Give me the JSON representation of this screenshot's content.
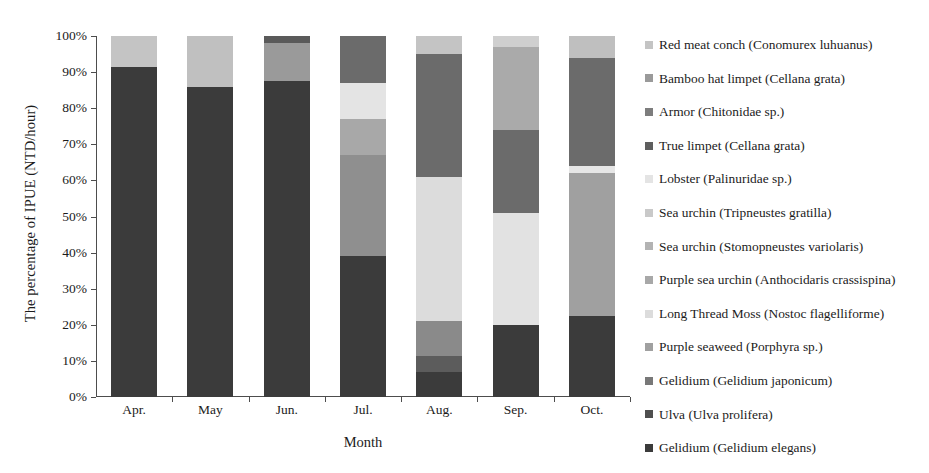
{
  "chart_data": {
    "type": "bar",
    "stacked": true,
    "stack_normalized": true,
    "title": "",
    "xlabel": "Month",
    "ylabel": "The percentage of IPUE (NTD/hour)",
    "categories": [
      "Apr.",
      "May",
      "Jun.",
      "Jul.",
      "Aug.",
      "Sep.",
      "Oct."
    ],
    "ylim": [
      0,
      100
    ],
    "ytick_labels": [
      "0%",
      "10%",
      "20%",
      "30%",
      "40%",
      "50%",
      "60%",
      "70%",
      "80%",
      "90%",
      "100%"
    ],
    "ytick_values": [
      0,
      10,
      20,
      30,
      40,
      50,
      60,
      70,
      80,
      90,
      100
    ],
    "grid": false,
    "legend_position": "right",
    "units": "percent",
    "series": [
      {
        "name": "Gelidium (Gelidium elegans)",
        "color": "#3b3b3b",
        "values": [
          91.5,
          86.0,
          87.5,
          39.0,
          7.0,
          20.0,
          22.5
        ]
      },
      {
        "name": "Ulva (Ulva prolifera)",
        "color": "#4f4f4f",
        "values": [
          0,
          0,
          0,
          0,
          4.5,
          0,
          0
        ]
      },
      {
        "name": "Gelidium (Gelidium japonicum)",
        "color": "#6e6e6e",
        "values": [
          0,
          0,
          0,
          0,
          9.5,
          0,
          0
        ]
      },
      {
        "name": "Purple seaweed (Porphyra sp.)",
        "color": "#8f8f8f",
        "values": [
          0,
          0,
          0,
          28.0,
          0,
          0,
          39.5
        ]
      },
      {
        "name": "Long Thread Moss (Nostoc flagelliforme)",
        "color": "#d9d9d9",
        "values": [
          0,
          0,
          0,
          0,
          40.0,
          31.0,
          2.0
        ]
      },
      {
        "name": "Purple sea urchin (Anthocidaris crassispina)",
        "color": "#a8a8a8",
        "values": [
          0,
          0,
          0,
          10.0,
          0,
          0,
          0
        ]
      },
      {
        "name": "Sea urchin (Stomopneustes variolaris)",
        "color": "#bdbdbd",
        "values": [
          0,
          0,
          0,
          0,
          0,
          0,
          0
        ]
      },
      {
        "name": "Sea urchin (Tripneustes gratilla)",
        "color": "#b3b3b3",
        "values": [
          0,
          0,
          0,
          0,
          0,
          23.0,
          0
        ]
      },
      {
        "name": "Lobster (Palinuridae sp.)",
        "color": "#e8e8e8",
        "values": [
          0,
          0,
          0,
          10.0,
          0,
          0,
          0
        ]
      },
      {
        "name": "True limpet (Cellana grata)",
        "color": "#666666",
        "values": [
          0,
          0,
          2.0,
          13.0,
          34.0,
          23.0,
          30.0
        ]
      },
      {
        "name": "Armor (Chitonidae sp.)",
        "color": "#7d7d7d",
        "values": [
          0,
          0,
          0,
          0,
          0,
          0,
          0
        ]
      },
      {
        "name": "Bamboo hat limpet (Cellana grata)",
        "color": "#9a9a9a",
        "values": [
          0,
          0,
          10.5,
          0,
          0,
          0,
          0
        ]
      },
      {
        "name": "Red meat conch (Conomurex luhuanus)",
        "color": "#c4c4c4",
        "values": [
          8.5,
          14.0,
          0,
          0,
          5.0,
          3.0,
          6.0
        ]
      }
    ],
    "stacks": [
      {
        "category": "Apr.",
        "segments": [
          {
            "label": "Gelidium (Gelidium elegans)",
            "from": 0,
            "to": 91.5,
            "value": 91.5,
            "color": "#3b3b3b"
          },
          {
            "label": "Red meat conch (Conomurex luhuanus)",
            "from": 91.5,
            "to": 100,
            "value": 8.5,
            "color": "#c4c4c4"
          }
        ]
      },
      {
        "category": "May",
        "segments": [
          {
            "label": "Gelidium (Gelidium elegans)",
            "from": 0,
            "to": 86.0,
            "value": 86.0,
            "color": "#3b3b3b"
          },
          {
            "label": "Red meat conch (Conomurex luhuanus)",
            "from": 86.0,
            "to": 100,
            "value": 14.0,
            "color": "#c0c0c0"
          }
        ]
      },
      {
        "category": "Jun.",
        "segments": [
          {
            "label": "Gelidium (Gelidium elegans)",
            "from": 0,
            "to": 87.5,
            "value": 87.5,
            "color": "#3b3b3b"
          },
          {
            "label": "Bamboo hat limpet (Cellana grata)",
            "from": 87.5,
            "to": 98.0,
            "value": 10.5,
            "color": "#9a9a9a"
          },
          {
            "label": "True limpet (Cellana grata)",
            "from": 98.0,
            "to": 100,
            "value": 2.0,
            "color": "#5a5a5a"
          }
        ]
      },
      {
        "category": "Jul.",
        "segments": [
          {
            "label": "Gelidium (Gelidium elegans)",
            "from": 0,
            "to": 39.0,
            "value": 39.0,
            "color": "#3b3b3b"
          },
          {
            "label": "Purple seaweed (Porphyra sp.)",
            "from": 39.0,
            "to": 67.0,
            "value": 28.0,
            "color": "#8f8f8f"
          },
          {
            "label": "Purple sea urchin (Anthocidaris crassispina)",
            "from": 67.0,
            "to": 77.0,
            "value": 10.0,
            "color": "#a8a8a8"
          },
          {
            "label": "Lobster (Palinuridae sp.)",
            "from": 77.0,
            "to": 87.0,
            "value": 10.0,
            "color": "#e4e4e4"
          },
          {
            "label": "True limpet (Cellana grata)",
            "from": 87.0,
            "to": 100,
            "value": 13.0,
            "color": "#6b6b6b"
          }
        ]
      },
      {
        "category": "Aug.",
        "segments": [
          {
            "label": "Gelidium (Gelidium elegans)",
            "from": 0,
            "to": 7.0,
            "value": 7.0,
            "color": "#3b3b3b"
          },
          {
            "label": "Ulva (Ulva prolifera)",
            "from": 7.0,
            "to": 11.5,
            "value": 4.5,
            "color": "#5c5c5c"
          },
          {
            "label": "Gelidium (Gelidium japonicum)",
            "from": 11.5,
            "to": 21.0,
            "value": 9.5,
            "color": "#8a8a8a"
          },
          {
            "label": "Long Thread Moss (Nostoc flagelliforme)",
            "from": 21.0,
            "to": 61.0,
            "value": 40.0,
            "color": "#dcdcdc"
          },
          {
            "label": "True limpet (Cellana grata)",
            "from": 61.0,
            "to": 95.0,
            "value": 34.0,
            "color": "#6b6b6b"
          },
          {
            "label": "Red meat conch (Conomurex luhuanus)",
            "from": 95.0,
            "to": 100,
            "value": 5.0,
            "color": "#c4c4c4"
          }
        ]
      },
      {
        "category": "Sep.",
        "segments": [
          {
            "label": "Gelidium (Gelidium elegans)",
            "from": 0,
            "to": 20.0,
            "value": 20.0,
            "color": "#3b3b3b"
          },
          {
            "label": "Long Thread Moss (Nostoc flagelliforme)",
            "from": 20.0,
            "to": 51.0,
            "value": 31.0,
            "color": "#e2e2e2"
          },
          {
            "label": "True limpet (Cellana grata)",
            "from": 51.0,
            "to": 74.0,
            "value": 23.0,
            "color": "#6b6b6b"
          },
          {
            "label": "Sea urchin (Tripneustes gratilla)",
            "from": 74.0,
            "to": 97.0,
            "value": 23.0,
            "color": "#aaaaaa"
          },
          {
            "label": "Red meat conch (Conomurex luhuanus)",
            "from": 97.0,
            "to": 100,
            "value": 3.0,
            "color": "#cfcfcf"
          }
        ]
      },
      {
        "category": "Oct.",
        "segments": [
          {
            "label": "Gelidium (Gelidium elegans)",
            "from": 0,
            "to": 22.5,
            "value": 22.5,
            "color": "#3b3b3b"
          },
          {
            "label": "Purple seaweed (Porphyra sp.)",
            "from": 22.5,
            "to": 62.0,
            "value": 39.5,
            "color": "#a0a0a0"
          },
          {
            "label": "Long Thread Moss (Nostoc flagelliforme)",
            "from": 62.0,
            "to": 64.0,
            "value": 2.0,
            "color": "#e6e6e6"
          },
          {
            "label": "True limpet (Cellana grata)",
            "from": 64.0,
            "to": 94.0,
            "value": 30.0,
            "color": "#6b6b6b"
          },
          {
            "label": "Red meat conch (Conomurex luhuanus)",
            "from": 94.0,
            "to": 100,
            "value": 6.0,
            "color": "#bfbfbf"
          }
        ]
      }
    ],
    "legend": [
      {
        "label": "Red meat conch (Conomurex luhuanus)",
        "color": "#c4c4c4"
      },
      {
        "label": "Bamboo hat limpet (Cellana grata)",
        "color": "#9a9a9a"
      },
      {
        "label": "Armor (Chitonidae sp.)",
        "color": "#7d7d7d"
      },
      {
        "label": "True limpet (Cellana grata)",
        "color": "#5e5e5e"
      },
      {
        "label": "Lobster (Palinuridae sp.)",
        "color": "#e4e4e4"
      },
      {
        "label": "Sea urchin (Tripneustes gratilla)",
        "color": "#c9c9c9"
      },
      {
        "label": "Sea urchin (Stomopneustes variolaris)",
        "color": "#b3b3b3"
      },
      {
        "label": "Purple sea urchin (Anthocidaris crassispina)",
        "color": "#a8a8a8"
      },
      {
        "label": "Long Thread Moss (Nostoc flagelliforme)",
        "color": "#dcdcdc"
      },
      {
        "label": "Purple seaweed (Porphyra sp.)",
        "color": "#a0a0a0"
      },
      {
        "label": "Gelidium (Gelidium japonicum)",
        "color": "#787878"
      },
      {
        "label": "Ulva (Ulva prolifera)",
        "color": "#4f4f4f"
      },
      {
        "label": "Gelidium (Gelidium elegans)",
        "color": "#3b3b3b"
      }
    ]
  }
}
